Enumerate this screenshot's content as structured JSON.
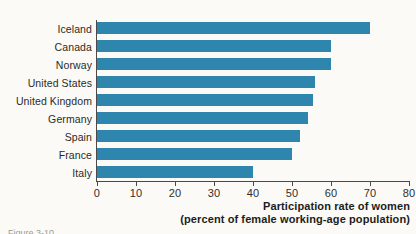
{
  "chart_data": {
    "type": "bar",
    "orientation": "horizontal",
    "title": "",
    "categories": [
      "Iceland",
      "Canada",
      "Norway",
      "United States",
      "United Kingdom",
      "Germany",
      "Spain",
      "France",
      "Italy"
    ],
    "values": [
      70,
      60,
      60,
      56,
      55.5,
      54,
      52,
      50,
      40
    ],
    "xlabel_line1": "Participation rate of women",
    "xlabel_line2": "(percent of female working-age population)",
    "ylabel": "",
    "xlim": [
      0,
      80
    ],
    "xticks": [
      0,
      10,
      20,
      30,
      40,
      50,
      60,
      70,
      80
    ],
    "xtick_labels": [
      "0",
      "10",
      "20",
      "30",
      "40",
      "50",
      "60",
      "70",
      "80"
    ],
    "grid": false,
    "legend": "none",
    "bar_color": "#2e85ad",
    "axis_color": "#4a4a48",
    "background": "#fbfaf7"
  },
  "figure": {
    "caption_partial": "Figure 3-10"
  }
}
